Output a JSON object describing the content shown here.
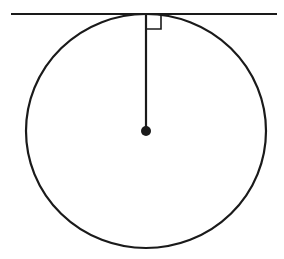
{
  "diagram": {
    "title": "Tangent line perpendicular to radius",
    "colors": {
      "stroke": "#1a1a1a",
      "background": "#ffffff"
    },
    "tangent_line": {
      "x1": 11,
      "y1": 14,
      "x2": 277,
      "y2": 14
    },
    "circle": {
      "cx": 146,
      "cy": 131,
      "rx": 120,
      "ry": 117
    },
    "radius": {
      "x1": 146,
      "y1": 14,
      "x2": 146,
      "y2": 131
    },
    "center_point": {
      "cx": 146,
      "cy": 131,
      "r": 5
    },
    "right_angle_marker": {
      "x": 146,
      "y": 14,
      "size": 15
    }
  }
}
